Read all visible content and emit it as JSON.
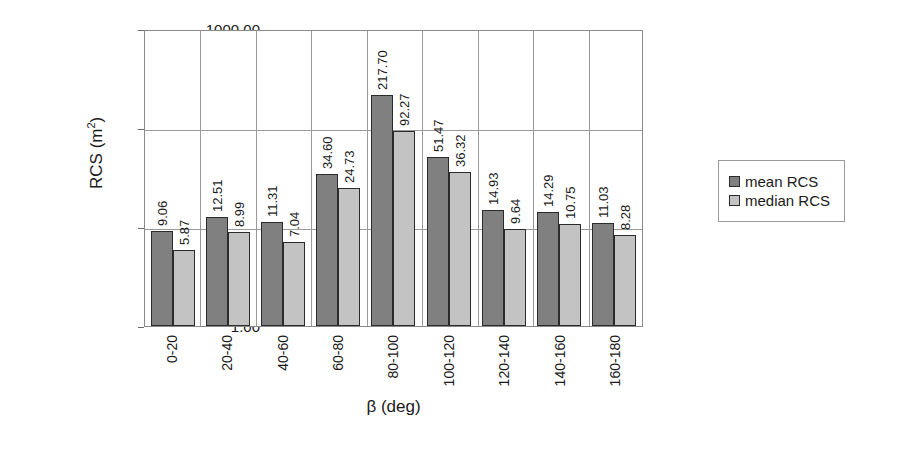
{
  "chart_data": {
    "type": "bar",
    "title": "",
    "xlabel": "β (deg)",
    "ylabel": "RCS (m²)",
    "ylabel_base": "RCS (m",
    "ylabel_sup": "2",
    "ylabel_tail": ")",
    "yscale": "log",
    "ylim": [
      1,
      1000
    ],
    "ytick_labels": [
      "1000.00",
      "100.00",
      "10.00",
      "1.00"
    ],
    "ytick_values": [
      1000,
      100,
      10,
      1
    ],
    "grid": true,
    "legend_position": "right",
    "categories": [
      "0-20",
      "20-40",
      "40-60",
      "60-80",
      "80-100",
      "100-120",
      "120-140",
      "140-160",
      "160-180"
    ],
    "series": [
      {
        "name": "mean RCS",
        "color": "#808080",
        "values": [
          9.06,
          12.51,
          11.31,
          34.6,
          217.7,
          51.47,
          14.93,
          14.29,
          11.03
        ],
        "labels": [
          "9.06",
          "12.51",
          "11.31",
          "34.60",
          "217.70",
          "51.47",
          "14.93",
          "14.29",
          "11.03"
        ]
      },
      {
        "name": "median RCS",
        "color": "#c3c3c3",
        "values": [
          5.87,
          8.99,
          7.04,
          24.73,
          92.27,
          36.32,
          9.64,
          10.75,
          8.28
        ],
        "labels": [
          "5.87",
          "8.99",
          "7.04",
          "24.73",
          "92.27",
          "36.32",
          "9.64",
          "10.75",
          "8.28"
        ]
      }
    ]
  },
  "legend": {
    "entries": [
      {
        "label": "mean RCS",
        "swatch": "legend-swatch-mean"
      },
      {
        "label": "median RCS",
        "swatch": "legend-swatch-median"
      }
    ]
  }
}
